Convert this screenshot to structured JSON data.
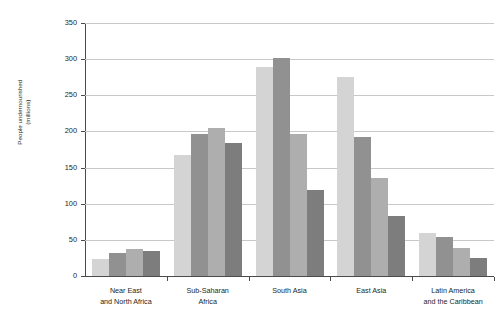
{
  "chart_data": {
    "type": "bar",
    "title": "",
    "xlabel": "",
    "ylabel": "People undernourished\n(millions)",
    "ylim": [
      0,
      350
    ],
    "ytick_step": 50,
    "yticks": [
      0,
      50,
      100,
      150,
      200,
      250,
      300,
      350
    ],
    "grid": true,
    "legend": "none",
    "categories": [
      "Near East\nand North Africa",
      "Sub-Saharan\nAfrica",
      "South Asia",
      "East Asia",
      "Latin America\nand the Caribbean"
    ],
    "series": [
      {
        "name": "series-1",
        "color": "#d4d4d4",
        "values": [
          23,
          168,
          289,
          275,
          59
        ]
      },
      {
        "name": "series-2",
        "color": "#919191",
        "values": [
          32,
          197,
          302,
          192,
          54
        ]
      },
      {
        "name": "series-3",
        "color": "#aeaeae",
        "values": [
          37,
          205,
          196,
          135,
          39
        ]
      },
      {
        "name": "series-4",
        "color": "#7d7d7d",
        "values": [
          34,
          184,
          119,
          83,
          25
        ]
      }
    ]
  },
  "axis": {
    "y_title": "People undernourished\n(millions)",
    "y_tick_labels": [
      "0",
      "50",
      "100",
      "150",
      "200",
      "250",
      "300",
      "350"
    ],
    "x_tick_labels": [
      "Near East\nand North Africa",
      "Sub-Saharan\nAfrica",
      "South Asia",
      "East Asia",
      "Latin America\nand the Caribbean"
    ]
  },
  "colors": {
    "series_1": "#d4d4d4",
    "series_2": "#919191",
    "series_3": "#aeaeae",
    "series_4": "#7d7d7d",
    "grid": "#c8c8c8",
    "axis": "#4a4a4a",
    "text": "#231f20",
    "background": "#ffffff"
  }
}
